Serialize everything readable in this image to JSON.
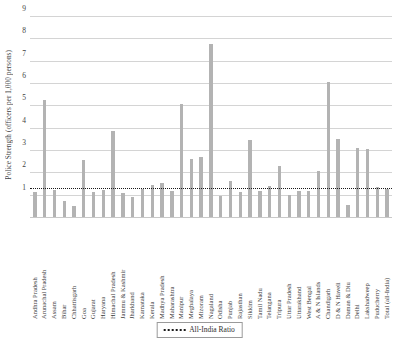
{
  "chart_data": {
    "type": "bar",
    "title": "",
    "xlabel": "",
    "ylabel": "Police Strength (officers per 1,000 persons)",
    "ylim": [
      0,
      9
    ],
    "yticks": [
      1,
      2,
      3,
      4,
      5,
      6,
      7,
      8,
      9
    ],
    "grid": true,
    "legend_position": "bottom-center",
    "bar_color": "#b3b3b3",
    "reference_line": {
      "label": "All-India Ratio",
      "value": 1.3,
      "style": "dotted",
      "color": "#1a1a1a"
    },
    "categories": [
      "Andhra Pradesh",
      "Arunachal Pradesh",
      "Assam",
      "Bihar",
      "Chhattisgarh",
      "Goa",
      "Gujarat",
      "Haryana",
      "Himachal Pradesh",
      "Jammu & Kashmir",
      "Jharkhand",
      "Karnataka",
      "Kerala",
      "Madhya Pradesh",
      "Maharashtra",
      "Manipur",
      "Meghalaya",
      "Mizoram",
      "Nagaland",
      "Odisha",
      "Punjab",
      "Rajasthan",
      "Sikkim",
      "Tamil Nadu",
      "Telangana",
      "Tripura",
      "Uttar Pradesh",
      "Uttarakhand",
      "West Bengal",
      "A & N Islands",
      "Chandigarh",
      "D & N Haveli",
      "Daman & Diu",
      "Delhi",
      "Lakshadweep",
      "Puducherry",
      "Total (all-India)"
    ],
    "values": [
      1.15,
      5.3,
      1.25,
      0.75,
      0.55,
      2.6,
      1.15,
      1.25,
      3.9,
      1.1,
      0.95,
      1.3,
      1.5,
      1.55,
      1.2,
      5.1,
      2.65,
      2.75,
      7.8,
      1.0,
      1.65,
      1.15,
      3.5,
      1.2,
      1.45,
      2.35,
      1.05,
      1.2,
      1.2,
      2.1,
      6.1,
      3.55,
      0.6,
      3.15,
      3.1,
      1.4,
      1.3
    ]
  },
  "legend": {
    "entries": [
      {
        "label": "All-India Ratio",
        "marker": "dotted-line"
      }
    ]
  }
}
